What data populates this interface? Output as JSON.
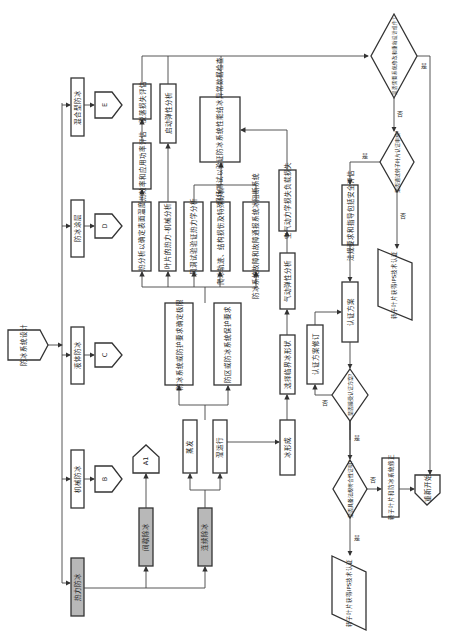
{
  "diagram": {
    "orientation": "rotated-90-ccw",
    "start": "防冰系统设计",
    "branches": [
      {
        "id": "thermal",
        "label": "热力防冰",
        "shaded": true
      },
      {
        "id": "mechanical",
        "label": "机械防冰",
        "connector": "B"
      },
      {
        "id": "liquid",
        "label": "液体防冰",
        "connector": "C"
      },
      {
        "id": "coating",
        "label": "防冰涂层",
        "connector": "D"
      },
      {
        "id": "hybrid",
        "label": "混合型防冰",
        "connector": "E"
      }
    ],
    "thermal_sub": {
      "intermittent": {
        "label": "间歇除冰",
        "connector": "A1"
      },
      "continuous": {
        "label": "连续除冰"
      }
    },
    "modes": [
      "蒸发",
      "湿运行"
    ],
    "requirements": [
      "防冰系统或防护要求确定极限",
      "防区或防冰系统保护要求"
    ],
    "analyses": [
      "热分析以确定表面温度",
      "叶片的热力-机械分析",
      "风洞试验验证热力学分析",
      "爬冰轨迹、结构损伤及特殊分析",
      "防冰系统故障和故障通报系统冰阻断系统"
    ],
    "analysis_followups": [
      "热效率和应用功率评估",
      "脱落损失评估",
      "启动弹性分析"
    ],
    "field_test": "现场测试以验证防冰系统性能结冰异常数据检查",
    "ice_path": [
      "冰形成",
      "选择临界冰形状",
      "气动弹性分析",
      "空气动力学损失负载损失"
    ],
    "certification": {
      "plan": "认证方案",
      "revise": "认证方案修订",
      "regs": "法规要求和指导包括安全评估",
      "decision_accept": "是否接受认证方案?",
      "decision_standard": "是否具备法规符合性证明?",
      "decision_pass": "是否通过转子叶片认证审核?",
      "decision_redesign": "是否需要系统修改和重新设计组件?",
      "fix": "转子叶片和防冰系统修正",
      "restart": "重新开始",
      "out1": "转子叶片获得IPS技术认证",
      "out2": "转子叶片获得IPS技术认证",
      "yes": "是",
      "no": "否"
    }
  }
}
